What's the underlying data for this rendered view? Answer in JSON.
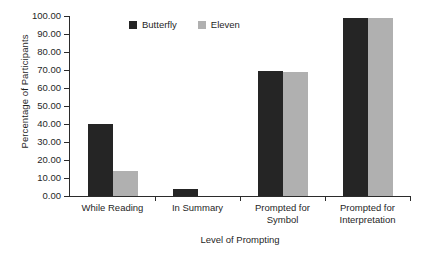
{
  "chart_data": {
    "type": "bar",
    "title": "",
    "xlabel": "Level of Prompting",
    "ylabel": "Percentage of Participants",
    "categories": [
      "While Reading",
      "In Summary",
      "Prompted for Symbol",
      "Prompted for Interpretation"
    ],
    "category_lines": [
      [
        "While Reading"
      ],
      [
        "In Summary"
      ],
      [
        "Prompted for",
        "Symbol"
      ],
      [
        "Prompted for",
        "Interpretation"
      ]
    ],
    "series": [
      {
        "name": "Butterfly",
        "color": "#252525",
        "values": [
          40,
          4,
          69.5,
          99
        ]
      },
      {
        "name": "Eleven",
        "color": "#b0b0b0",
        "values": [
          14,
          0,
          69,
          99
        ]
      }
    ],
    "ylim": [
      0,
      100
    ],
    "ytick_values": [
      0,
      10,
      20,
      30,
      40,
      50,
      60,
      70,
      80,
      90,
      100
    ],
    "ytick_labels": [
      "0.00",
      "10.00",
      "20.00",
      "30.00",
      "40.00",
      "50.00",
      "60.00",
      "70.00",
      "80.00",
      "90.00",
      "100.00"
    ],
    "grid": false,
    "legend_position": "inside-top-center",
    "bar_group_gap": true,
    "bars_adjacent_within_group": true
  },
  "legend": {
    "items": [
      {
        "label": "Butterfly",
        "swatch": "dark-square-swatch"
      },
      {
        "label": "Eleven",
        "swatch": "gray-square-swatch"
      }
    ]
  }
}
